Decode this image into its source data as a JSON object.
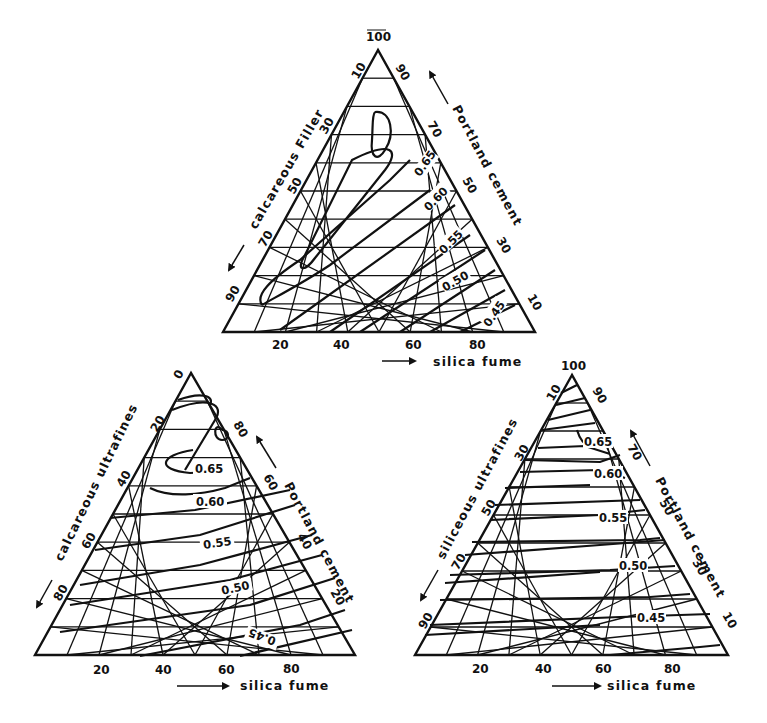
{
  "figure": {
    "panels": [
      {
        "id": "top",
        "apex_label": "100",
        "left_axis": {
          "label": "calcareous Filler",
          "ticks": [
            "10",
            "30",
            "50",
            "70",
            "90"
          ]
        },
        "right_axis": {
          "label": "Portland cement",
          "ticks": [
            "90",
            "70",
            "50",
            "30",
            "10"
          ]
        },
        "bottom_axis": {
          "label": "silica fume",
          "ticks": [
            "20",
            "40",
            "60",
            "80"
          ]
        },
        "contours": [
          "0.65",
          "0.60",
          "0.55",
          "0.50",
          "0.45"
        ]
      },
      {
        "id": "bottom-left",
        "apex_label": "0",
        "left_axis": {
          "label": "calcareous ultrafines",
          "ticks": [
            "20",
            "40",
            "60",
            "80"
          ]
        },
        "right_axis": {
          "label": "Portland cement",
          "ticks": [
            "80",
            "60",
            "40",
            "20"
          ]
        },
        "bottom_axis": {
          "label": "silica fume",
          "ticks": [
            "20",
            "40",
            "60",
            "80"
          ]
        },
        "contours": [
          "0.65",
          "0.60",
          "0.55",
          "0.50",
          "0.45"
        ]
      },
      {
        "id": "bottom-right",
        "apex_label": "100",
        "left_axis": {
          "label": "siliceous ultrafines",
          "ticks": [
            "10",
            "30",
            "50",
            "70",
            "90"
          ]
        },
        "right_axis": {
          "label": "Portland cement",
          "ticks": [
            "90",
            "70",
            "50",
            "30",
            "10"
          ]
        },
        "bottom_axis": {
          "label": "silica fume",
          "ticks": [
            "20",
            "40",
            "60",
            "80"
          ]
        },
        "contours": [
          "0.65",
          "0.60",
          "0.55",
          "0.50",
          "0.45"
        ]
      }
    ]
  },
  "chart_data": [
    {
      "type": "ternary-contour",
      "title": "",
      "components": [
        "silica fume",
        "calcareous Filler",
        "Portland cement"
      ],
      "axis_ticks": {
        "silica fume": [
          20,
          40,
          60,
          80
        ],
        "calcareous Filler": [
          10,
          30,
          50,
          70,
          90
        ],
        "Portland cement": [
          10,
          30,
          50,
          70,
          90
        ]
      },
      "apex_label": "100",
      "contour_levels": [
        0.65,
        0.6,
        0.55,
        0.5,
        0.45
      ],
      "grid": true
    },
    {
      "type": "ternary-contour",
      "title": "",
      "components": [
        "silica fume",
        "calcareous ultrafines",
        "Portland cement"
      ],
      "axis_ticks": {
        "silica fume": [
          20,
          40,
          60,
          80
        ],
        "calcareous ultrafines": [
          20,
          40,
          60,
          80
        ],
        "Portland cement": [
          20,
          40,
          60,
          80
        ]
      },
      "apex_label": "0",
      "contour_levels": [
        0.65,
        0.6,
        0.55,
        0.5,
        0.45
      ],
      "grid": true
    },
    {
      "type": "ternary-contour",
      "title": "",
      "components": [
        "silica fume",
        "siliceous ultrafines",
        "Portland cement"
      ],
      "axis_ticks": {
        "silica fume": [
          20,
          40,
          60,
          80
        ],
        "siliceous ultrafines": [
          10,
          30,
          50,
          70,
          90
        ],
        "Portland cement": [
          10,
          30,
          50,
          70,
          90
        ]
      },
      "apex_label": "100",
      "contour_levels": [
        0.65,
        0.6,
        0.55,
        0.5,
        0.45
      ],
      "grid": true
    }
  ]
}
